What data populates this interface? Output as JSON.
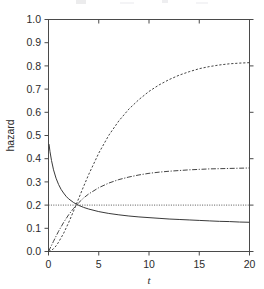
{
  "figure": {
    "background_color": "#ffffff",
    "line_color": "#3a3a3a",
    "axis_color": "#4a4a4a"
  },
  "chart_data": {
    "type": "line",
    "title": "",
    "xlabel": "t",
    "ylabel": "hazard",
    "xlim": [
      0,
      20
    ],
    "ylim": [
      0.0,
      1.0
    ],
    "grid": false,
    "legend": "none",
    "xticks": [
      0,
      5,
      10,
      15,
      20
    ],
    "xtick_labels": [
      "0",
      "5",
      "10",
      "15",
      "20"
    ],
    "yticks": [
      0.0,
      0.1,
      0.2,
      0.3,
      0.4,
      0.5,
      0.6,
      0.7,
      0.8,
      0.9,
      1.0
    ],
    "ytick_labels": [
      "0.0",
      "0.1",
      "0.2",
      "0.3",
      "0.4",
      "0.5",
      "0.6",
      "0.7",
      "0.8",
      "0.9",
      "1.0"
    ],
    "series": [
      {
        "name": "decreasing-hazard",
        "style": "solid",
        "x": [
          0.05,
          0.15,
          0.3,
          0.5,
          0.75,
          1.0,
          1.25,
          1.5,
          1.75,
          2.0,
          2.5,
          3.0,
          3.5,
          4.0,
          5.0,
          6.0,
          7.0,
          8.0,
          9.0,
          10.0,
          11.0,
          12.0,
          13.0,
          14.0,
          15.0,
          16.0,
          17.0,
          18.0,
          19.0,
          20.0
        ],
        "y": [
          0.463,
          0.43,
          0.392,
          0.352,
          0.316,
          0.289,
          0.268,
          0.252,
          0.238,
          0.227,
          0.211,
          0.199,
          0.19,
          0.183,
          0.172,
          0.164,
          0.158,
          0.153,
          0.149,
          0.146,
          0.143,
          0.14,
          0.138,
          0.136,
          0.134,
          0.132,
          0.13,
          0.129,
          0.127,
          0.126
        ]
      },
      {
        "name": "steep-increasing-hazard",
        "style": "dashed",
        "x": [
          0.0,
          0.25,
          0.5,
          0.75,
          1.0,
          1.5,
          2.0,
          2.5,
          3.0,
          3.5,
          4.0,
          5.0,
          6.0,
          7.0,
          8.0,
          9.0,
          10.0,
          11.0,
          12.0,
          13.0,
          14.0,
          15.0,
          16.0,
          17.0,
          18.0,
          19.0,
          20.0
        ],
        "y": [
          0.0,
          0.004,
          0.012,
          0.024,
          0.04,
          0.078,
          0.124,
          0.175,
          0.228,
          0.281,
          0.332,
          0.424,
          0.501,
          0.563,
          0.614,
          0.655,
          0.69,
          0.718,
          0.741,
          0.76,
          0.775,
          0.788,
          0.797,
          0.804,
          0.809,
          0.812,
          0.814
        ]
      },
      {
        "name": "moderate-increasing-hazard",
        "style": "dashdot",
        "x": [
          0.0,
          0.25,
          0.5,
          0.75,
          1.0,
          1.5,
          2.0,
          2.5,
          3.0,
          3.5,
          4.0,
          5.0,
          6.0,
          7.0,
          8.0,
          9.0,
          10.0,
          11.0,
          12.0,
          13.0,
          14.0,
          15.0,
          16.0,
          17.0,
          18.0,
          19.0,
          20.0
        ],
        "y": [
          0.0,
          0.022,
          0.044,
          0.066,
          0.087,
          0.125,
          0.158,
          0.186,
          0.21,
          0.231,
          0.248,
          0.275,
          0.295,
          0.31,
          0.321,
          0.33,
          0.337,
          0.342,
          0.346,
          0.349,
          0.352,
          0.354,
          0.356,
          0.357,
          0.358,
          0.359,
          0.36
        ]
      },
      {
        "name": "constant-hazard",
        "style": "dotted",
        "x": [
          0.0,
          20.0
        ],
        "y": [
          0.2,
          0.2
        ]
      }
    ]
  }
}
